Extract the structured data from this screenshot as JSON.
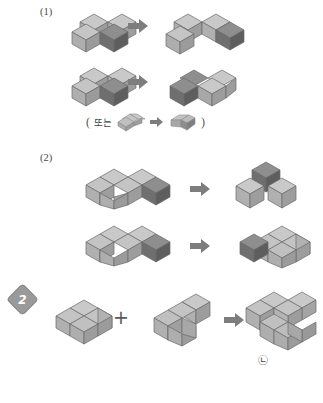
{
  "page": {
    "background": "#ffffff",
    "width": 323,
    "height": 403
  },
  "palette": {
    "light_top": "#c9c9c9",
    "light_left": "#b0b0b0",
    "light_right": "#9d9d9d",
    "dark_top": "#8e8e8e",
    "dark_left": "#6f6f6f",
    "dark_right": "#5e5e5e",
    "mid_top": "#b8b8b8",
    "mid_left": "#a0a0a0",
    "mid_right": "#8c8c8c",
    "outline": "#6a6a6a",
    "arrow": "#7d7d7d",
    "badge": "#9a9a9a",
    "text": "#3a3a3a"
  },
  "sections": {
    "one": {
      "label": "(1)",
      "rows": [
        {
          "name": "row-1a",
          "source_blocks": 4,
          "result_blocks": 4,
          "arrow": "block-arrow-right"
        },
        {
          "name": "row-1b",
          "source_blocks": 4,
          "result_blocks": 4,
          "arrow": "block-arrow-right"
        }
      ],
      "alt_note": {
        "open_paren": "(",
        "text": "또는",
        "arrow": "small-block-arrow-right",
        "close_paren": ")"
      }
    },
    "two": {
      "label": "(2)",
      "rows": [
        {
          "name": "row-2a",
          "source_blocks": 4,
          "result_blocks": 3,
          "arrow": "block-arrow-right"
        },
        {
          "name": "row-2b",
          "source_blocks": 4,
          "result_blocks": 4,
          "arrow": "block-arrow-right"
        }
      ]
    },
    "problem": {
      "badge_number": "2",
      "operator": "+",
      "arrow": "block-arrow-right",
      "addend_a_blocks": 4,
      "addend_b_blocks": 5,
      "result_blocks": 9,
      "result_label": "㉡"
    }
  }
}
